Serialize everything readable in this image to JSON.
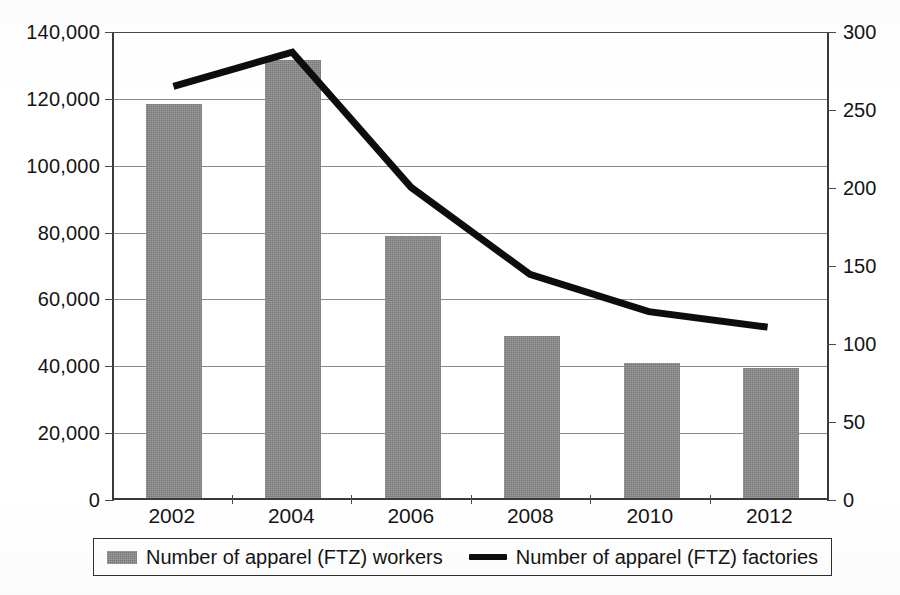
{
  "chart_data": {
    "type": "bar",
    "title": "",
    "xlabel": "",
    "ylabel": "",
    "grid": true,
    "legend_position": "bottom",
    "categories": [
      "2002",
      "2004",
      "2006",
      "2008",
      "2010",
      "2012"
    ],
    "axes": {
      "left": {
        "label": "Number of apparel (FTZ) workers",
        "ticks": [
          "140,000",
          "120,000",
          "100,000",
          "80,000",
          "60,000",
          "40,000",
          "20,000",
          "0"
        ],
        "tick_values": [
          140000,
          120000,
          100000,
          80000,
          60000,
          40000,
          20000,
          0
        ],
        "ylim": [
          0,
          140000
        ],
        "step": 20000
      },
      "right": {
        "label": "Number of apparel (FTZ) factories",
        "ticks": [
          "300",
          "250",
          "200",
          "150",
          "100",
          "50",
          "0"
        ],
        "tick_values": [
          300,
          250,
          200,
          150,
          100,
          50,
          0
        ],
        "ylim": [
          0,
          300
        ],
        "step": 50
      }
    },
    "series": [
      {
        "name": "Number of apparel (FTZ) workers",
        "type": "bar",
        "axis": "left",
        "color": "#858585",
        "values": [
          118000,
          131000,
          78500,
          48500,
          40500,
          39000
        ]
      },
      {
        "name": "Number of apparel (FTZ) factories",
        "type": "line",
        "axis": "right",
        "color": "#0d0d0d",
        "values": [
          265,
          287,
          200,
          144,
          120,
          110
        ]
      }
    ]
  },
  "legend": {
    "items": [
      {
        "label": "Number of apparel (FTZ) workers",
        "marker": "bar-swatch",
        "color": "#858585"
      },
      {
        "label": "Number of apparel (FTZ) factories",
        "marker": "line-swatch",
        "color": "#0d0d0d"
      }
    ]
  }
}
